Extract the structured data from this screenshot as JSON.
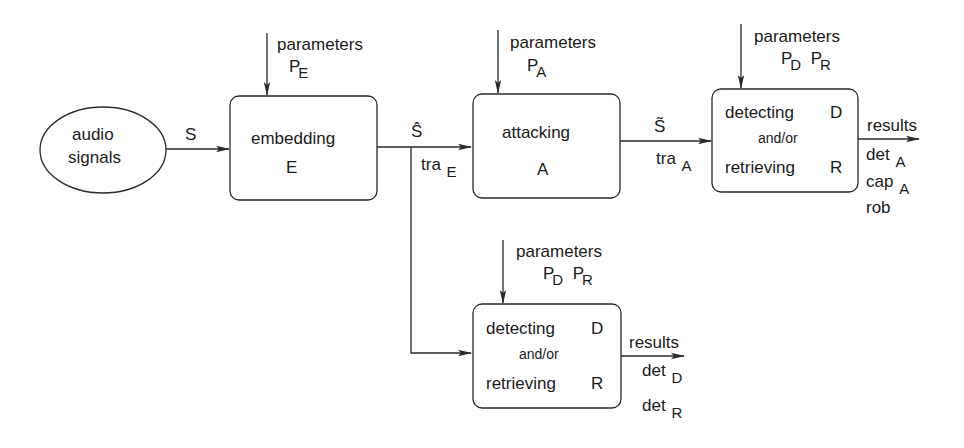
{
  "source": {
    "label_line1": "audio",
    "label_line2": "signals",
    "output_signal": "S"
  },
  "embedding": {
    "params_label": "parameters",
    "param_symbol": "P",
    "param_sub": "E",
    "title": "embedding",
    "symbol": "E",
    "output_signal": "Ŝ",
    "output_tra": "tra",
    "output_tra_sub": "E"
  },
  "attacking": {
    "params_label": "parameters",
    "param_symbol": "P",
    "param_sub": "A",
    "title": "attacking",
    "symbol": "A",
    "output_signal": "S̃",
    "output_tra": "tra",
    "output_tra_sub": "A"
  },
  "detect_top": {
    "params_label": "parameters",
    "param1_symbol": "P",
    "param1_sub": "D",
    "param2_symbol": "P",
    "param2_sub": "R",
    "line1": "detecting",
    "line1_symbol": "D",
    "connector": "and/or",
    "line2": "retrieving",
    "line2_symbol": "R",
    "results_label": "results",
    "results": [
      {
        "name": "det",
        "sub": "A"
      },
      {
        "name": "cap",
        "sub": "A"
      },
      {
        "name": "rob",
        "sub": ""
      }
    ]
  },
  "detect_bottom": {
    "params_label": "parameters",
    "param1_symbol": "P",
    "param1_sub": "D",
    "param2_symbol": "P",
    "param2_sub": "R",
    "line1": "detecting",
    "line1_symbol": "D",
    "connector": "and/or",
    "line2": "retrieving",
    "line2_symbol": "R",
    "results_label": "results",
    "results": [
      {
        "name": "det",
        "sub": "D"
      },
      {
        "name": "det",
        "sub": "R"
      }
    ]
  },
  "colors": {
    "stroke": "#2a2a2a",
    "text": "#1a1a1a",
    "background": "#ffffff"
  }
}
